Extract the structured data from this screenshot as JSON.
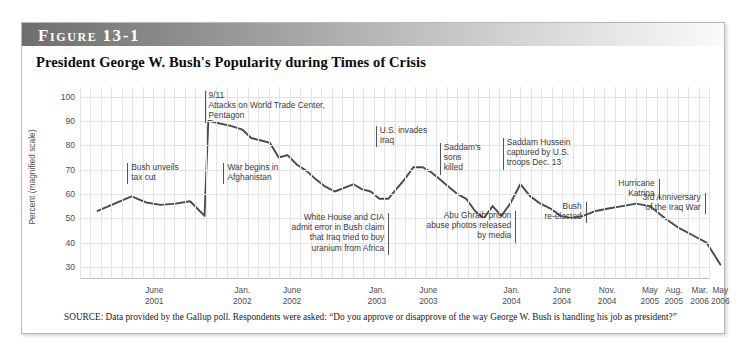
{
  "figure": {
    "label_word": "Figure",
    "label_number": "13-1",
    "title": "President George W. Bush's Popularity during Times of Crisis",
    "source": "SOURCE: Data provided by the Gallup poll. Respondents were asked: “Do you approve or disapprove of the way George W. Bush is handling his job as president?”"
  },
  "chart_data": {
    "type": "line",
    "title": "President George W. Bush's Popularity during Times of Crisis",
    "xlabel": "",
    "ylabel": "Percent (magnified scale)",
    "ylim": [
      25,
      104
    ],
    "yticks": [
      30,
      40,
      50,
      60,
      70,
      80,
      90,
      100
    ],
    "grid": true,
    "legend": "none",
    "line_color": "#4a4a4a",
    "xtick_labels": [
      {
        "line1": "June",
        "line2": "2001",
        "pos": 0.118
      },
      {
        "line1": "Jan.",
        "line2": "2002",
        "pos": 0.258
      },
      {
        "line1": "June",
        "line2": "2002",
        "pos": 0.337
      },
      {
        "line1": "Jan.",
        "line2": "2003",
        "pos": 0.472
      },
      {
        "line1": "June",
        "line2": "2003",
        "pos": 0.554
      },
      {
        "line1": "Jan.",
        "line2": "2004",
        "pos": 0.686
      },
      {
        "line1": "June",
        "line2": "2004",
        "pos": 0.766
      },
      {
        "line1": "Nov.",
        "line2": "2004",
        "pos": 0.838
      },
      {
        "line1": "May",
        "line2": "2005",
        "pos": 0.906
      },
      {
        "line1": "Aug.",
        "line2": "2005",
        "pos": 0.944
      },
      {
        "line1": "Mar.",
        "line2": "2006",
        "pos": 0.985
      },
      {
        "line1": "May",
        "line2": "2006",
        "pos": 1.018
      }
    ],
    "x": [
      0.028,
      0.055,
      0.082,
      0.105,
      0.128,
      0.152,
      0.175,
      0.198,
      0.204,
      0.207,
      0.222,
      0.24,
      0.258,
      0.272,
      0.288,
      0.302,
      0.316,
      0.33,
      0.345,
      0.36,
      0.375,
      0.39,
      0.405,
      0.42,
      0.435,
      0.448,
      0.462,
      0.476,
      0.49,
      0.503,
      0.516,
      0.53,
      0.545,
      0.558,
      0.572,
      0.586,
      0.6,
      0.614,
      0.628,
      0.642,
      0.656,
      0.67,
      0.684,
      0.7,
      0.716,
      0.732,
      0.748,
      0.764,
      0.782,
      0.8,
      0.82,
      0.84,
      0.862,
      0.884,
      0.906,
      0.93,
      0.952,
      0.974,
      0.996,
      1.018
    ],
    "values": [
      53,
      56,
      59,
      56.5,
      55.5,
      56,
      57,
      51,
      90,
      90,
      89,
      88,
      86.5,
      83,
      82,
      81,
      75,
      76,
      72,
      69.5,
      66,
      63,
      61,
      62.5,
      64,
      62,
      61,
      58,
      58,
      62,
      66,
      71,
      71,
      69,
      66,
      63,
      60,
      58,
      53,
      50,
      55,
      51,
      56,
      64,
      59,
      56,
      54,
      51,
      50,
      51,
      53,
      54,
      55,
      56,
      55,
      50,
      46,
      43,
      40,
      31
    ],
    "annotations": [
      {
        "id": "bush-unveils-tax-cut",
        "text": "Bush unveils\ntax cut",
        "x": 0.075,
        "y_top": 76
      },
      {
        "id": "nine-eleven",
        "text": "9/11\nAttacks on World Trade Center,\nPentagon",
        "x": 0.198,
        "y_top": 4
      },
      {
        "id": "war-begins-afghanistan",
        "text": "War begins in\nAfghanistan",
        "x": 0.228,
        "y_top": 76
      },
      {
        "id": "white-house-cia-uranium",
        "text": "White House and CIA\nadmit error in Bush claim\nthat Iraq tried to buy\nuranium from Africa",
        "x": 0.49,
        "y_top": 126
      },
      {
        "id": "us-invades-iraq",
        "text": "U.S. invades\nIraq",
        "x": 0.47,
        "y_top": 39
      },
      {
        "id": "saddams-sons-killed",
        "text": "Saddam's\nsons\nkilled",
        "x": 0.572,
        "y_top": 56
      },
      {
        "id": "saddam-hussein-captured",
        "text": "Saddam Hussein\ncaptured by U.S.\ntroops Dec. 13",
        "x": 0.672,
        "y_top": 51
      },
      {
        "id": "abu-ghraib-photos",
        "text": "Abu Ghraib prison\nabuse photos released\nby media",
        "x": 0.692,
        "y_top": 124
      },
      {
        "id": "bush-re-elected",
        "text": "Bush\nre-elected",
        "x": 0.804,
        "y_top": 115
      },
      {
        "id": "hurricane-katrina",
        "text": "Hurricane\nKatrina",
        "x": 0.92,
        "y_top": 92
      },
      {
        "id": "third-anniversary-iraq-war",
        "text": "3rd Anniversary\nof the Iraq War",
        "x": 0.993,
        "y_top": 106
      }
    ]
  }
}
